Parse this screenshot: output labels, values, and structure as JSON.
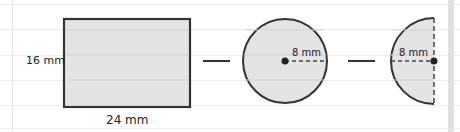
{
  "diagram": {
    "type": "composite-shape-subtraction",
    "shapes": [
      {
        "id": "rectangle",
        "width_label": "24 mm",
        "height_label": "16 mm"
      },
      {
        "id": "circle",
        "radius_label": "8 mm"
      },
      {
        "id": "semicircle",
        "radius_label": "8 mm"
      }
    ],
    "operators": [
      "—",
      "—"
    ],
    "labels": {
      "rect_height": "16 mm",
      "rect_width": "24 mm",
      "circle_radius": "8 mm",
      "semicircle_radius": "8 mm"
    },
    "colors": {
      "fill": "#e4e4e4",
      "stroke": "#333333",
      "background": "#ffffff"
    }
  }
}
